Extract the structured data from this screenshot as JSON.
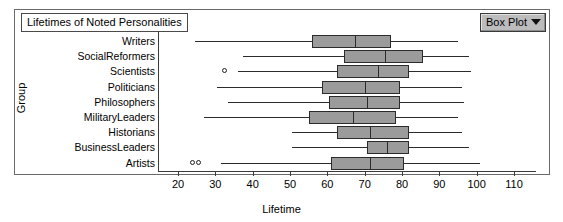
{
  "chart_data": {
    "type": "box",
    "title": "Lifetimes of Noted Personalities",
    "xlabel": "Lifetime",
    "ylabel": "Group",
    "xlim": [
      15,
      115
    ],
    "xticks": [
      20,
      30,
      40,
      50,
      60,
      70,
      80,
      90,
      100,
      110
    ],
    "xtick_labels": [
      "20",
      "30",
      "40",
      "50",
      "60",
      "70",
      "80",
      "90",
      "100",
      "110"
    ],
    "grid": false,
    "legend": "none",
    "categories": [
      "Writers",
      "SocialReformers",
      "Scientists",
      "Politicians",
      "Philosophers",
      "MilitaryLeaders",
      "Historians",
      "BusinessLeaders",
      "Artists"
    ],
    "boxes": [
      {
        "group": "Writers",
        "whisker_low": 24.5,
        "q1": 56.0,
        "median": 67.5,
        "q3": 77.0,
        "whisker_high": 95.0,
        "outliers": []
      },
      {
        "group": "SocialReformers",
        "whisker_low": 37.5,
        "q1": 64.5,
        "median": 75.5,
        "q3": 85.5,
        "whisker_high": 98.0,
        "outliers": []
      },
      {
        "group": "Scientists",
        "whisker_low": 36.0,
        "q1": 62.5,
        "median": 73.5,
        "q3": 82.0,
        "whisker_high": 98.5,
        "outliers": [
          32.5
        ]
      },
      {
        "group": "Politicians",
        "whisker_low": 30.5,
        "q1": 58.5,
        "median": 70.0,
        "q3": 79.5,
        "whisker_high": 96.0,
        "outliers": []
      },
      {
        "group": "Philosophers",
        "whisker_low": 33.5,
        "q1": 60.5,
        "median": 70.5,
        "q3": 79.5,
        "whisker_high": 96.5,
        "outliers": []
      },
      {
        "group": "MilitaryLeaders",
        "whisker_low": 27.0,
        "q1": 55.0,
        "median": 67.0,
        "q3": 78.5,
        "whisker_high": 95.0,
        "outliers": []
      },
      {
        "group": "Historians",
        "whisker_low": 50.5,
        "q1": 62.5,
        "median": 71.5,
        "q3": 82.0,
        "whisker_high": 96.0,
        "outliers": []
      },
      {
        "group": "BusinessLeaders",
        "whisker_low": 50.5,
        "q1": 70.5,
        "median": 76.0,
        "q3": 82.0,
        "whisker_high": 98.0,
        "outliers": []
      },
      {
        "group": "Artists",
        "whisker_low": 31.5,
        "q1": 61.0,
        "median": 71.5,
        "q3": 80.5,
        "whisker_high": 101.0,
        "outliers": [
          24.0,
          25.5
        ]
      }
    ]
  },
  "controls": {
    "plot_type_selector": {
      "label": "Box Plot",
      "caret_icon": "chevron-down-icon"
    }
  }
}
